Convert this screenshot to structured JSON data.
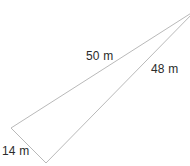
{
  "figure": {
    "type": "triangle-diagram",
    "canvas": {
      "width": 190,
      "height": 166
    },
    "background_color": "#ffffff",
    "stroke_color": "#b9b9b9",
    "stroke_width": 1,
    "text_color": "#2b2b2b",
    "vertices": {
      "left": {
        "x": 11,
        "y": 128
      },
      "bottom": {
        "x": 46,
        "y": 163
      },
      "apex": {
        "x": 196,
        "y": 10
      }
    },
    "sides": [
      {
        "name": "upper-side",
        "label": "50 m",
        "value": 50,
        "unit": "m",
        "from": "left",
        "to": "apex"
      },
      {
        "name": "lower-side",
        "label": "48 m",
        "value": 48,
        "unit": "m",
        "from": "bottom",
        "to": "apex"
      },
      {
        "name": "short-side",
        "label": "14 m",
        "value": 14,
        "unit": "m",
        "from": "left",
        "to": "bottom"
      }
    ]
  }
}
